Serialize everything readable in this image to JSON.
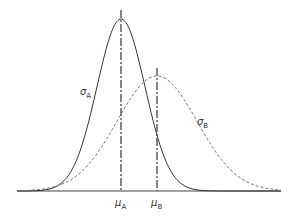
{
  "chart_data": {
    "type": "line",
    "title": "",
    "xlabel": "",
    "ylabel": "",
    "grid": false,
    "legend": null,
    "series": [
      {
        "name": "A",
        "style": "solid",
        "color": "#333333",
        "mean_px": 121,
        "sigma_px": 24,
        "peak_px_y": 19,
        "label": "σ_A"
      },
      {
        "name": "B",
        "style": "dashed",
        "color": "#777777",
        "mean_px": 157,
        "sigma_px": 40,
        "peak_px_y": 76,
        "label": "σ_B"
      }
    ],
    "annotations": [
      {
        "text": "μ_A",
        "type": "mean-line",
        "series": "A"
      },
      {
        "text": "μ_B",
        "type": "mean-line",
        "series": "B"
      },
      {
        "text": "σ_A",
        "type": "curve-label",
        "series": "A"
      },
      {
        "text": "σ_B",
        "type": "curve-label",
        "series": "B"
      }
    ],
    "axis": {
      "x_start_px": 17,
      "x_end_px": 281,
      "baseline_px_y": 191
    }
  },
  "labels": {
    "sigma_a": "σ",
    "sigma_a_sub": "A",
    "sigma_b": "σ",
    "sigma_b_sub": "B",
    "mu_a": "μ",
    "mu_a_sub": "A",
    "mu_b": "μ",
    "mu_b_sub": "B"
  }
}
